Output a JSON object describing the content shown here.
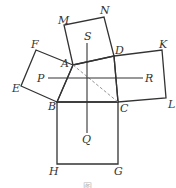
{
  "figure": {
    "type": "geometric-construction",
    "stroke_color": "#333333",
    "dashed_color": "#888888",
    "points": {
      "A": [
        73,
        65
      ],
      "B": [
        57,
        102
      ],
      "C": [
        118,
        102
      ],
      "D": [
        114,
        56
      ],
      "M": [
        64,
        25
      ],
      "N": [
        104,
        17
      ],
      "F": [
        36,
        50
      ],
      "E": [
        21,
        86
      ],
      "K": [
        162,
        50
      ],
      "L": [
        166,
        98
      ],
      "H": [
        57,
        164
      ],
      "G": [
        118,
        164
      ],
      "P": [
        48,
        78
      ],
      "R": [
        143,
        78
      ],
      "S": [
        87,
        43
      ],
      "Q": [
        87,
        133
      ]
    },
    "labels": [
      {
        "text": "M",
        "x": 58,
        "y": 24
      },
      {
        "text": "N",
        "x": 100,
        "y": 14
      },
      {
        "text": "F",
        "x": 31,
        "y": 48
      },
      {
        "text": "E",
        "x": 12,
        "y": 92
      },
      {
        "text": "A",
        "x": 61,
        "y": 67
      },
      {
        "text": "S",
        "x": 84,
        "y": 40
      },
      {
        "text": "D",
        "x": 115,
        "y": 54
      },
      {
        "text": "K",
        "x": 159,
        "y": 48
      },
      {
        "text": "P",
        "x": 37,
        "y": 82
      },
      {
        "text": "R",
        "x": 145,
        "y": 82
      },
      {
        "text": "B",
        "x": 48,
        "y": 110
      },
      {
        "text": "C",
        "x": 120,
        "y": 112
      },
      {
        "text": "L",
        "x": 168,
        "y": 108
      },
      {
        "text": "Q",
        "x": 82,
        "y": 143
      },
      {
        "text": "H",
        "x": 49,
        "y": 175
      },
      {
        "text": "G",
        "x": 114,
        "y": 175
      }
    ],
    "caption": "图"
  }
}
